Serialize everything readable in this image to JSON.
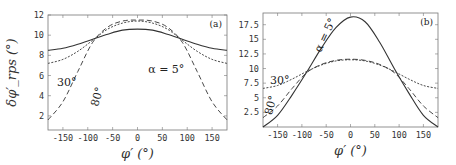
{
  "chart_data": [
    {
      "type": "line",
      "panel_label": "(a)",
      "title": "",
      "xlabel": "φ′ (°)",
      "ylabel": "δφ′_rps (°)",
      "xlim": [
        -180,
        180
      ],
      "ylim": [
        0.6,
        12
      ],
      "xticks": [
        -150,
        -100,
        -50,
        0,
        50,
        100,
        150
      ],
      "yticks": [
        2,
        4,
        6,
        8,
        10,
        12
      ],
      "xtick_labels": [
        "-150",
        "-100",
        "-50",
        "0",
        "50",
        "100",
        "150"
      ],
      "ytick_labels": [
        "2",
        "4",
        "6",
        "8",
        "10",
        "12"
      ],
      "grid": false,
      "annotations": [
        "α = 5°",
        "30°",
        "80°"
      ],
      "x": [
        -180,
        -150,
        -120,
        -90,
        -60,
        -30,
        0,
        30,
        60,
        90,
        120,
        150,
        180
      ],
      "series": [
        {
          "name": "α = 5°",
          "style": "solid",
          "values": [
            8.5,
            8.7,
            9.1,
            9.6,
            10.1,
            10.5,
            10.6,
            10.5,
            10.1,
            9.6,
            9.1,
            8.7,
            8.5
          ]
        },
        {
          "name": "30°",
          "style": "dotted",
          "values": [
            7.2,
            7.6,
            8.4,
            9.5,
            10.6,
            11.2,
            11.4,
            11.2,
            10.6,
            9.5,
            8.4,
            7.6,
            7.2
          ]
        },
        {
          "name": "80°",
          "style": "dashed",
          "values": [
            1.6,
            3.4,
            6.4,
            9.3,
            10.8,
            11.4,
            11.5,
            11.4,
            10.8,
            9.3,
            6.4,
            3.4,
            1.6
          ]
        }
      ]
    },
    {
      "type": "line",
      "panel_label": "(b)",
      "title": "",
      "xlabel": "φ′ (°)",
      "ylabel": "",
      "xlim": [
        -180,
        180
      ],
      "ylim": [
        0,
        19.5
      ],
      "xticks": [
        -150,
        -100,
        -50,
        0,
        50,
        100,
        150
      ],
      "yticks": [
        2.5,
        5,
        7.5,
        10,
        12.5,
        15,
        17.5
      ],
      "xtick_labels": [
        "-150",
        "-100",
        "-50",
        "0",
        "50",
        "100",
        "150"
      ],
      "ytick_labels": [
        "2.5",
        "5",
        "7.5",
        "10",
        "12.5",
        "15",
        "17.5"
      ],
      "grid": false,
      "annotations": [
        "α = 5°",
        "30°",
        "80°"
      ],
      "x": [
        -180,
        -150,
        -120,
        -90,
        -60,
        -30,
        0,
        30,
        60,
        90,
        120,
        150,
        180
      ],
      "series": [
        {
          "name": "α = 5°",
          "style": "solid",
          "values": [
            0.0,
            2.0,
            5.5,
            9.4,
            13.5,
            17.0,
            18.8,
            18.0,
            14.5,
            10.0,
            5.8,
            2.0,
            0.0
          ]
        },
        {
          "name": "30°",
          "style": "dotted",
          "values": [
            6.6,
            7.1,
            8.2,
            9.5,
            10.6,
            11.3,
            11.5,
            11.3,
            10.6,
            9.5,
            8.2,
            7.1,
            6.6
          ]
        },
        {
          "name": "80°",
          "style": "dashed",
          "values": [
            1.6,
            3.6,
            6.6,
            9.3,
            10.7,
            11.4,
            11.6,
            11.4,
            10.7,
            9.3,
            6.6,
            3.6,
            1.6
          ]
        }
      ]
    }
  ]
}
